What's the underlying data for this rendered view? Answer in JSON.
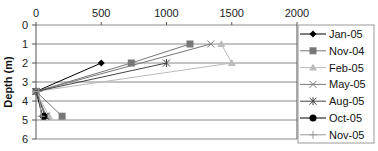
{
  "chart_data": {
    "type": "line",
    "title": "",
    "xlabel": "",
    "ylabel": "Depth (m)",
    "xlim": [
      0,
      2000
    ],
    "ylim": [
      0,
      6
    ],
    "y_inverted": true,
    "x_axis_position": "top",
    "x_ticks": [
      "0",
      "500",
      "1000",
      "1500",
      "2000"
    ],
    "y_ticks": [
      "0",
      "1",
      "2",
      "3",
      "4",
      "5",
      "6"
    ],
    "grid": "horizontal",
    "legend_position": "right",
    "series": [
      {
        "name": "Jan-05",
        "color": "#000000",
        "marker": "diamond",
        "points": [
          [
            500,
            2
          ],
          [
            0,
            3.5
          ],
          [
            50,
            4.8
          ]
        ]
      },
      {
        "name": "Nov-04",
        "color": "#777777",
        "marker": "square",
        "points": [
          [
            1180,
            1
          ],
          [
            730,
            2
          ],
          [
            0,
            3.5
          ],
          [
            200,
            4.8
          ]
        ]
      },
      {
        "name": "Feb-05",
        "color": "#bbbbbb",
        "marker": "triangle",
        "points": [
          [
            1420,
            1
          ],
          [
            1500,
            2
          ],
          [
            0,
            3.5
          ],
          [
            100,
            4.8
          ]
        ]
      },
      {
        "name": "May-05",
        "color": "#777777",
        "marker": "x",
        "points": [
          [
            1340,
            1
          ],
          [
            0,
            3.5
          ],
          [
            80,
            4.8
          ]
        ]
      },
      {
        "name": "Aug-05",
        "color": "#444444",
        "marker": "star",
        "points": [
          [
            1000,
            2
          ],
          [
            0,
            3.5
          ],
          [
            70,
            4.8
          ]
        ]
      },
      {
        "name": "Oct-05",
        "color": "#000000",
        "marker": "circle",
        "points": [
          [
            60,
            4.8
          ]
        ]
      },
      {
        "name": "Nov-05",
        "color": "#999999",
        "marker": "plus",
        "points": [
          [
            20,
            3.5
          ],
          [
            40,
            4.8
          ]
        ]
      }
    ]
  }
}
